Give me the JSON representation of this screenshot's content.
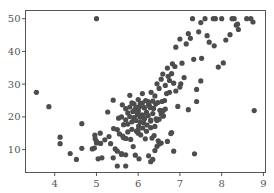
{
  "chart_data": {
    "type": "scatter",
    "title": "",
    "xlabel": "",
    "ylabel": "",
    "xlim": [
      3.3,
      9.05
    ],
    "ylim": [
      3,
      52.5
    ],
    "grid": false,
    "legend": null,
    "x_ticks": [
      4,
      5,
      6,
      7,
      8,
      9
    ],
    "y_ticks": [
      10,
      20,
      30,
      40,
      50
    ],
    "x_tick_labels": [
      "4",
      "5",
      "6",
      "7",
      "8",
      "9"
    ],
    "y_tick_labels": [
      "10",
      "20",
      "30",
      "40",
      "50"
    ],
    "marker_color": "#4d4d4d",
    "series": [
      {
        "name": "points",
        "x": [
          3.56,
          3.86,
          4.13,
          4.13,
          4.37,
          4.52,
          4.65,
          4.65,
          4.9,
          4.96,
          4.97,
          5.0,
          5.0,
          5.04,
          5.09,
          5.13,
          5.27,
          5.34,
          5.4,
          5.41,
          5.45,
          5.5,
          5.53,
          5.6,
          5.62,
          5.63,
          5.7,
          5.71,
          5.75,
          5.8,
          5.82,
          5.85,
          5.87,
          5.88,
          5.9,
          5.92,
          5.93,
          5.95,
          5.96,
          5.98,
          6.0,
          6.01,
          6.02,
          6.03,
          6.05,
          6.06,
          6.08,
          6.1,
          6.11,
          6.13,
          6.14,
          6.15,
          6.17,
          6.18,
          6.2,
          6.21,
          6.23,
          6.24,
          6.25,
          6.27,
          6.29,
          6.3,
          6.31,
          6.33,
          6.35,
          6.37,
          6.38,
          6.4,
          6.42,
          6.43,
          6.45,
          6.47,
          6.48,
          6.5,
          6.52,
          6.55,
          6.57,
          6.59,
          6.6,
          6.63,
          6.65,
          6.68,
          6.7,
          6.72,
          6.75,
          6.78,
          6.8,
          6.82,
          6.85,
          6.88,
          6.9,
          6.95,
          7.0,
          7.02,
          7.05,
          7.1,
          7.15,
          7.2,
          7.25,
          7.3,
          7.33,
          7.4,
          7.45,
          7.5,
          7.52,
          7.6,
          7.65,
          7.7,
          7.8,
          7.82,
          7.85,
          7.92,
          8.0,
          8.04,
          8.25,
          8.3,
          8.38,
          8.4,
          8.7,
          8.78,
          5.8,
          5.9,
          6.0,
          6.1,
          6.2,
          6.3,
          5.7,
          5.5,
          5.6,
          5.85,
          5.95,
          6.05,
          6.15,
          6.25,
          6.35,
          6.45,
          5.65,
          5.75,
          5.55,
          6.4,
          6.5,
          6.55,
          6.6,
          6.7,
          6.3,
          6.0,
          5.9,
          5.8,
          5.7,
          6.2,
          6.1,
          5.4,
          5.3,
          5.2,
          5.1,
          5.0,
          4.95,
          6.8,
          6.85,
          7.35,
          6.0,
          5.7,
          5.6,
          5.5,
          6.4,
          6.45,
          6.0,
          6.3,
          6.35,
          6.9,
          7.0,
          7.2,
          7.4,
          7.5,
          8.1,
          8.2,
          8.35,
          8.6,
          8.75,
          6.5,
          6.6,
          5.95,
          6.05,
          6.15,
          6.25,
          5.85,
          5.75,
          5.65,
          6.55,
          6.65,
          6.75
        ],
        "y": [
          27.5,
          23.1,
          13.8,
          11.8,
          8.8,
          7.0,
          17.9,
          10.4,
          10.2,
          14.4,
          13.3,
          50.0,
          12.0,
          7.2,
          15.0,
          7.5,
          21.5,
          11.8,
          7.5,
          16.4,
          10.2,
          5.0,
          19.6,
          8.5,
          23.7,
          14.1,
          5.0,
          13.4,
          17.8,
          20.1,
          13.1,
          18.5,
          21.6,
          10.9,
          19.4,
          22.2,
          8.3,
          18.9,
          15.6,
          20.6,
          21.7,
          17.2,
          7.2,
          23.1,
          19.9,
          14.5,
          20.5,
          24.2,
          16.6,
          18.2,
          22.9,
          19.6,
          13.3,
          25.0,
          21.2,
          17.5,
          24.7,
          20.4,
          8.1,
          23.3,
          22.8,
          19.0,
          27.5,
          13.5,
          24.8,
          22.6,
          14.3,
          26.4,
          23.9,
          19.4,
          30.1,
          24.4,
          12.7,
          28.7,
          22.0,
          31.5,
          24.7,
          33.1,
          21.9,
          25.0,
          29.6,
          27.1,
          34.9,
          32.4,
          31.1,
          14.9,
          33.2,
          36.2,
          30.3,
          35.4,
          41.3,
          23.2,
          43.8,
          30.1,
          36.4,
          32.0,
          42.3,
          45.4,
          44.0,
          50.0,
          37.6,
          24.7,
          46.0,
          48.8,
          37.9,
          50.0,
          44.8,
          42.8,
          50.0,
          41.7,
          50.0,
          35.2,
          50.0,
          36.5,
          50.0,
          50.0,
          48.3,
          46.7,
          50.0,
          21.9,
          23.0,
          19.8,
          22.0,
          20.5,
          21.4,
          18.7,
          19.1,
          16.1,
          20.0,
          24.3,
          22.9,
          18.4,
          19.5,
          23.8,
          21.0,
          18.9,
          17.6,
          21.2,
          14.8,
          17.1,
          11.7,
          20.9,
          20.3,
          12.5,
          16.7,
          25.3,
          24.0,
          26.6,
          22.5,
          15.6,
          27.1,
          25.1,
          14.0,
          13.0,
          11.9,
          12.5,
          10.5,
          15.2,
          9.5,
          8.7,
          16.1,
          8.4,
          8.8,
          9.5,
          9.7,
          11.0,
          15.0,
          6.3,
          7.0,
          27.9,
          29.1,
          22.2,
          28.4,
          31.0,
          43.5,
          45.1,
          48.0,
          50.0,
          49.0,
          19.3,
          20.3,
          21.6,
          24.1,
          22.7,
          24.5,
          16.2,
          15.4,
          13.6,
          12.0,
          22.4,
          27.5
        ]
      }
    ]
  }
}
